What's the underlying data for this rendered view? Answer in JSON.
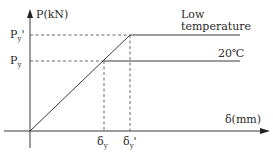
{
  "diagram": {
    "type": "load-displacement",
    "y_axis_label": "P(kN)",
    "x_axis_label": "δ(mm)",
    "y_ticks": [
      {
        "id": "py_prime",
        "base": "P",
        "sub": "y",
        "prime": "'"
      },
      {
        "id": "py",
        "base": "P",
        "sub": "y",
        "prime": ""
      }
    ],
    "x_ticks": [
      {
        "id": "dy",
        "base": "δ",
        "sub": "y",
        "prime": ""
      },
      {
        "id": "dy_prime",
        "base": "δ",
        "sub": "y",
        "prime": "'"
      }
    ],
    "curves": [
      {
        "name": "Low temperature",
        "label_line1": "Low",
        "label_line2": "temperature"
      },
      {
        "name": "20℃",
        "label": "20℃"
      }
    ],
    "colors": {
      "line": "#3a3a3a",
      "dash": "#555555",
      "text": "#2a2a2a"
    }
  }
}
